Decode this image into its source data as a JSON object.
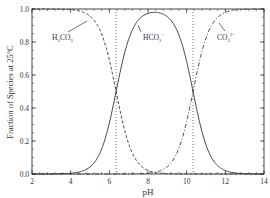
{
  "chart_data": {
    "type": "line",
    "title": "",
    "xlabel": "pH",
    "ylabel": "Fraction of Species at 25°C",
    "xlim": [
      2,
      14
    ],
    "ylim": [
      0.0,
      1.0
    ],
    "xticks": [
      2,
      4,
      6,
      8,
      10,
      12,
      14
    ],
    "xtick_labels": [
      "2",
      "4",
      "6",
      "8",
      "10",
      "12",
      "14"
    ],
    "yticks": [
      0.0,
      0.2,
      0.4,
      0.6,
      0.8,
      1.0
    ],
    "ytick_labels": [
      "0.0",
      "0.2",
      "0.4",
      "0.6",
      "0.8",
      "1.0"
    ],
    "grid": false,
    "legend": "none (inline annotations)",
    "pKa1": 6.35,
    "pKa2": 10.33,
    "reference_lines": [
      {
        "type": "vertical",
        "x": 6.35,
        "style": "dotted"
      },
      {
        "type": "vertical",
        "x": 10.33,
        "style": "dotted"
      }
    ],
    "x": [
      2,
      3,
      4,
      4.5,
      5,
      5.5,
      6,
      6.35,
      6.7,
      7,
      7.5,
      8,
      8.34,
      8.7,
      9,
      9.5,
      10,
      10.33,
      10.7,
      11,
      11.5,
      12,
      13,
      14
    ],
    "series": [
      {
        "name": "H2CO3",
        "label": "H₂CO₃",
        "style": "dashed",
        "values": [
          1.0,
          1.0,
          0.996,
          0.986,
          0.957,
          0.876,
          0.691,
          0.5,
          0.309,
          0.183,
          0.066,
          0.022,
          0.01,
          0.004,
          0.002,
          0.001,
          0.0,
          0.0,
          0.0,
          0.0,
          0.0,
          0.0,
          0.0,
          0.0
        ]
      },
      {
        "name": "HCO3-",
        "label": "HCO₃⁻",
        "style": "solid",
        "values": [
          0.0,
          0.0,
          0.004,
          0.014,
          0.043,
          0.124,
          0.309,
          0.5,
          0.69,
          0.813,
          0.925,
          0.958,
          0.98,
          0.951,
          0.907,
          0.757,
          0.491,
          0.5,
          0.299,
          0.176,
          0.063,
          0.021,
          0.002,
          0.0
        ]
      },
      {
        "name": "CO3 2-",
        "label": "CO₃²⁻",
        "style": "dash-dot",
        "values": [
          0.0,
          0.0,
          0.0,
          0.0,
          0.0,
          0.0,
          0.0,
          0.0,
          0.001,
          0.004,
          0.009,
          0.02,
          0.01,
          0.045,
          0.091,
          0.242,
          0.318,
          0.5,
          0.701,
          0.824,
          0.937,
          0.979,
          0.998,
          1.0
        ]
      }
    ],
    "annotations": [
      {
        "text": "H₂CO₃",
        "x": 4.1,
        "y": 0.82
      },
      {
        "text": "HCO₃⁻",
        "x": 8.3,
        "y": 0.82
      },
      {
        "text": "CO₃²⁻",
        "x": 11.4,
        "y": 0.82
      }
    ]
  },
  "labels": {
    "xlabel": "pH",
    "ylabel": "Fraction of Species at 25°C",
    "h2co3_main": "H",
    "h2co3_sub1": "2",
    "h2co3_mid": "CO",
    "h2co3_sub2": "3",
    "hco3_main": "HCO",
    "hco3_sub": "3",
    "hco3_sup": "−",
    "co3_main": "CO",
    "co3_sub": "3",
    "co3_sup": "2−"
  }
}
